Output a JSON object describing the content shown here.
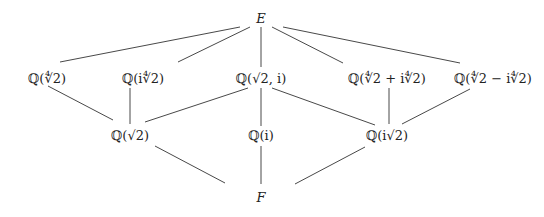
{
  "diagram": {
    "nodes": [
      {
        "id": "E",
        "label": "E",
        "x": 261,
        "y": 18,
        "italic": true
      },
      {
        "id": "q4r2",
        "label": "ℚ(∜2)",
        "x": 47,
        "y": 78
      },
      {
        "id": "qi4r2",
        "label": "ℚ(i∜2)",
        "x": 143,
        "y": 78
      },
      {
        "id": "qr2i",
        "label": "ℚ(√2, i)",
        "x": 261,
        "y": 78
      },
      {
        "id": "qsum",
        "label": "ℚ(∜2 + i∜2)",
        "x": 387,
        "y": 78
      },
      {
        "id": "qdiff",
        "label": "ℚ(∜2 − i∜2)",
        "x": 493,
        "y": 78
      },
      {
        "id": "qr2",
        "label": "ℚ(√2)",
        "x": 130,
        "y": 135
      },
      {
        "id": "qi",
        "label": "ℚ(i)",
        "x": 261,
        "y": 135
      },
      {
        "id": "qir2",
        "label": "ℚ(i√2)",
        "x": 387,
        "y": 135
      },
      {
        "id": "F",
        "label": "F",
        "x": 261,
        "y": 197,
        "italic": true
      }
    ],
    "edges": [
      {
        "x1": 240,
        "y1": 27,
        "x2": 60,
        "y2": 62
      },
      {
        "x1": 250,
        "y1": 27,
        "x2": 178,
        "y2": 62
      },
      {
        "x1": 261,
        "y1": 27,
        "x2": 261,
        "y2": 67
      },
      {
        "x1": 272,
        "y1": 27,
        "x2": 343,
        "y2": 63
      },
      {
        "x1": 283,
        "y1": 27,
        "x2": 460,
        "y2": 63
      },
      {
        "x1": 48,
        "y1": 86,
        "x2": 113,
        "y2": 120
      },
      {
        "x1": 130,
        "y1": 88,
        "x2": 130,
        "y2": 124
      },
      {
        "x1": 248,
        "y1": 88,
        "x2": 145,
        "y2": 122
      },
      {
        "x1": 261,
        "y1": 88,
        "x2": 261,
        "y2": 126
      },
      {
        "x1": 272,
        "y1": 88,
        "x2": 375,
        "y2": 125
      },
      {
        "x1": 389,
        "y1": 88,
        "x2": 389,
        "y2": 124
      },
      {
        "x1": 470,
        "y1": 89,
        "x2": 402,
        "y2": 124
      },
      {
        "x1": 155,
        "y1": 146,
        "x2": 225,
        "y2": 183
      },
      {
        "x1": 261,
        "y1": 146,
        "x2": 261,
        "y2": 184
      },
      {
        "x1": 365,
        "y1": 147,
        "x2": 295,
        "y2": 184
      }
    ]
  }
}
